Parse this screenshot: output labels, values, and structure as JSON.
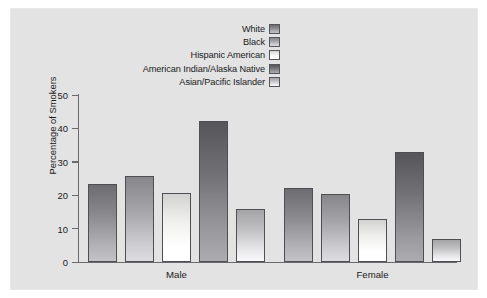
{
  "figure": {
    "background_color": "#ffffff",
    "panel_color": "#e3e3e3"
  },
  "legend": {
    "position": "top-right",
    "entries": [
      {
        "label": "White",
        "color": "#8f8f93"
      },
      {
        "label": "Black",
        "color": "#a9a9ad"
      },
      {
        "label": "Hispanic American",
        "color": "#f4f4f2"
      },
      {
        "label": "American Indian/Alaska Native",
        "color": "#78787c"
      },
      {
        "label": "Asian/Pacific Islander",
        "color": "#c6c6c8"
      }
    ]
  },
  "axes": {
    "y_label": "Percentage of Smokers",
    "y_ticks": [
      0,
      10,
      20,
      30,
      40,
      50
    ],
    "y_min": 0,
    "y_max": 50,
    "x_groups": [
      "Male",
      "Female"
    ],
    "grid": false
  },
  "chart_data": {
    "type": "bar",
    "title": "",
    "xlabel": "",
    "ylabel": "Percentage of Smokers",
    "ylim": [
      0,
      50
    ],
    "categories": [
      "Male",
      "Female"
    ],
    "series": [
      {
        "name": "White",
        "values": [
          23.4,
          22.1
        ],
        "color": "#8f8f93"
      },
      {
        "name": "Black",
        "values": [
          25.7,
          20.3
        ],
        "color": "#a9a9ad"
      },
      {
        "name": "Hispanic American",
        "values": [
          20.8,
          12.8
        ],
        "color": "#f4f4f2"
      },
      {
        "name": "American Indian/Alaska Native",
        "values": [
          42.2,
          32.8
        ],
        "color": "#78787c"
      },
      {
        "name": "Asian/Pacific Islander",
        "values": [
          15.9,
          6.8
        ],
        "color": "#c6c6c8"
      }
    ],
    "legend_position": "top-right",
    "grid": false
  }
}
